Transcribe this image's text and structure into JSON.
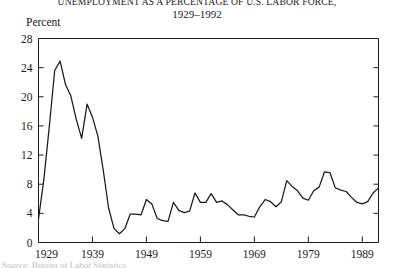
{
  "figure": {
    "title": "Unemployment as a Percentage of U.S. Labor Force,",
    "subtitle": "1929–1992",
    "axis_name": "Percent",
    "source_note": "Source: Bureau of Labor Statistics"
  },
  "chart_data": {
    "type": "line",
    "title": "Unemployment as a Percentage of U.S. Labor Force,",
    "subtitle": "1929–1992",
    "xlabel": "",
    "ylabel": "Percent",
    "xlim": [
      1929,
      1992
    ],
    "ylim": [
      0,
      28
    ],
    "grid": false,
    "legend": "none",
    "ytick_labels": [
      "0",
      "4",
      "8",
      "12",
      "16",
      "20",
      "24",
      "28"
    ],
    "yticks": [
      0,
      4,
      8,
      12,
      16,
      20,
      24,
      28
    ],
    "xtick_labels": [
      "1929",
      "1939",
      "1949",
      "1959",
      "1969",
      "1979",
      "1989"
    ],
    "xticks": [
      1929,
      1939,
      1949,
      1959,
      1969,
      1979,
      1989
    ],
    "series": [
      {
        "name": "Unemployment rate",
        "color": "#1a1a1a",
        "x": [
          1929,
          1930,
          1931,
          1932,
          1933,
          1934,
          1935,
          1936,
          1937,
          1938,
          1939,
          1940,
          1941,
          1942,
          1943,
          1944,
          1945,
          1946,
          1947,
          1948,
          1949,
          1950,
          1951,
          1952,
          1953,
          1954,
          1955,
          1956,
          1957,
          1958,
          1959,
          1960,
          1961,
          1962,
          1963,
          1964,
          1965,
          1966,
          1967,
          1968,
          1969,
          1970,
          1971,
          1972,
          1973,
          1974,
          1975,
          1976,
          1977,
          1978,
          1979,
          1980,
          1981,
          1982,
          1983,
          1984,
          1985,
          1986,
          1987,
          1988,
          1989,
          1990,
          1991,
          1992
        ],
        "values": [
          3.2,
          8.7,
          15.9,
          23.6,
          24.9,
          21.7,
          20.1,
          16.9,
          14.3,
          19.0,
          17.2,
          14.6,
          9.9,
          4.7,
          1.9,
          1.2,
          1.9,
          3.9,
          3.9,
          3.8,
          5.9,
          5.3,
          3.3,
          3.0,
          2.9,
          5.5,
          4.4,
          4.1,
          4.3,
          6.8,
          5.5,
          5.5,
          6.7,
          5.5,
          5.7,
          5.2,
          4.5,
          3.8,
          3.8,
          3.6,
          3.5,
          4.9,
          5.9,
          5.6,
          4.9,
          5.6,
          8.5,
          7.7,
          7.1,
          6.1,
          5.8,
          7.1,
          7.6,
          9.7,
          9.6,
          7.5,
          7.2,
          7.0,
          6.2,
          5.5,
          5.3,
          5.6,
          6.8,
          7.5
        ]
      }
    ]
  }
}
